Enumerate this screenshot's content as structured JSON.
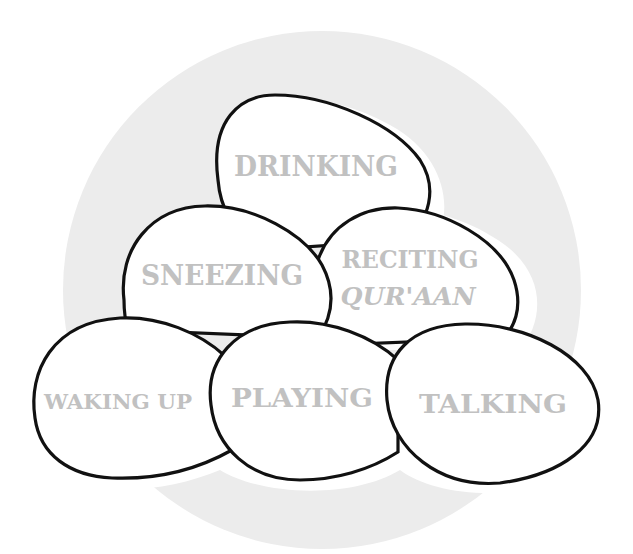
{
  "colors": {
    "background": "#ffffff",
    "circle": "#ececec",
    "egg_fill": "#ffffff",
    "egg_stroke": "#111111",
    "label": "#c1c1c1"
  },
  "eggs": [
    {
      "id": "drinking",
      "lines": [
        "DRINKING"
      ]
    },
    {
      "id": "reciting",
      "lines": [
        "RECITING",
        "QUR'AAN"
      ]
    },
    {
      "id": "sneezing",
      "lines": [
        "SNEEZING"
      ]
    },
    {
      "id": "waking-up",
      "lines": [
        "WAKING UP"
      ]
    },
    {
      "id": "playing",
      "lines": [
        "PLAYING"
      ]
    },
    {
      "id": "talking",
      "lines": [
        "TALKING"
      ]
    }
  ]
}
